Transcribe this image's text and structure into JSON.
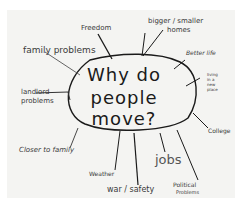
{
  "center": {
    "line1": "Why do",
    "line2": "people move?"
  },
  "branches": [
    {
      "label": "Freedom"
    },
    {
      "label": "bigger / smaller"
    },
    {
      "label": "homes"
    },
    {
      "label": "family problems"
    },
    {
      "label": "Better life"
    },
    {
      "label": "living in a new place"
    },
    {
      "label": "landlord"
    },
    {
      "label": "problems"
    },
    {
      "label": "College"
    },
    {
      "label": "Closer to family"
    },
    {
      "label": "jobs"
    },
    {
      "label": "Weather"
    },
    {
      "label": "war / safety"
    },
    {
      "label": "Political"
    },
    {
      "label": "Problems"
    }
  ],
  "colors": {
    "paper": "#f4f4f2",
    "ink": "#1a1a1a",
    "label_ink": "#3a3a3a"
  }
}
